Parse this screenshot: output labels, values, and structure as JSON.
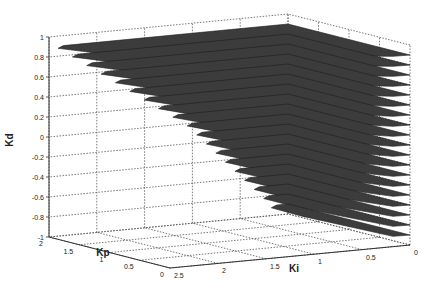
{
  "chart_data": {
    "type": "surface3d",
    "title": "",
    "xlabel": "Ki",
    "ylabel": "Kp",
    "zlabel": "Kd",
    "x_ticks": [
      "0",
      "0.5",
      "1",
      "1.5",
      "2",
      "2.5"
    ],
    "y_ticks": [
      "0",
      "0.5",
      "1",
      "1.5",
      "2"
    ],
    "z_ticks": [
      "1",
      "0.8",
      "0.6",
      "0.4",
      "0.2",
      "0",
      "-0.2",
      "-0.4",
      "-0.6",
      "-0.8",
      "-1"
    ],
    "xlim": [
      0,
      2.5
    ],
    "ylim": [
      0,
      2
    ],
    "zlim": [
      -1,
      1
    ],
    "grid": true,
    "surface_color": "#3c3c3c",
    "slices": [
      {
        "kd": 0.9,
        "ki_max": 2.35
      },
      {
        "kd": 0.8,
        "ki_max": 2.2
      },
      {
        "kd": 0.7,
        "ki_max": 2.05
      },
      {
        "kd": 0.6,
        "ki_max": 1.9
      },
      {
        "kd": 0.5,
        "ki_max": 1.75
      },
      {
        "kd": 0.4,
        "ki_max": 1.6
      },
      {
        "kd": 0.3,
        "ki_max": 1.45
      },
      {
        "kd": 0.2,
        "ki_max": 1.3
      },
      {
        "kd": 0.1,
        "ki_max": 1.15
      },
      {
        "kd": 0.0,
        "ki_max": 1.0
      },
      {
        "kd": -0.1,
        "ki_max": 0.9
      },
      {
        "kd": -0.2,
        "ki_max": 0.8
      },
      {
        "kd": -0.3,
        "ki_max": 0.7
      },
      {
        "kd": -0.4,
        "ki_max": 0.6
      },
      {
        "kd": -0.5,
        "ki_max": 0.5
      },
      {
        "kd": -0.6,
        "ki_max": 0.4
      },
      {
        "kd": -0.7,
        "ki_max": 0.3
      },
      {
        "kd": -0.8,
        "ki_max": 0.2
      },
      {
        "kd": -0.9,
        "ki_max": 0.12
      }
    ]
  }
}
